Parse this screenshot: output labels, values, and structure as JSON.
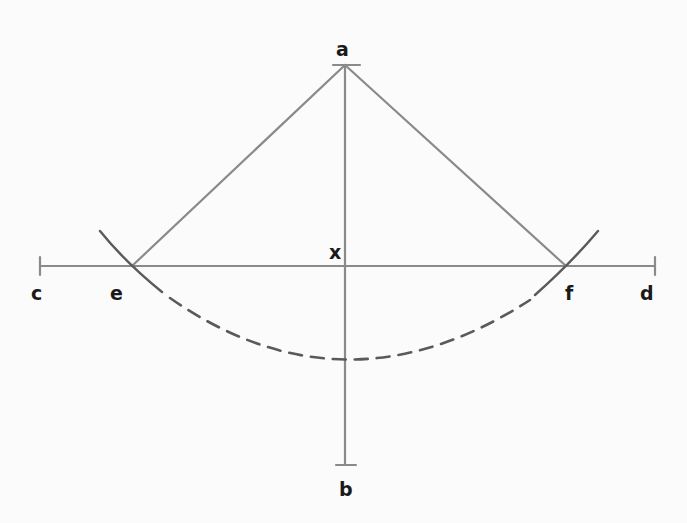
{
  "diagram": {
    "title": "",
    "points": {
      "a": {
        "label": "a",
        "x": 345,
        "y": 65
      },
      "b": {
        "label": "b",
        "x": 345,
        "y": 465
      },
      "c": {
        "label": "c",
        "x": 40,
        "y": 265
      },
      "d": {
        "label": "d",
        "x": 655,
        "y": 265
      },
      "e": {
        "label": "e",
        "x": 132,
        "y": 265
      },
      "f": {
        "label": "f",
        "x": 565,
        "y": 265
      },
      "x": {
        "label": "x",
        "x": 345,
        "y": 265
      }
    },
    "labels": {
      "a": "a",
      "b": "b",
      "c": "c",
      "d": "d",
      "e": "e",
      "f": "f",
      "x": "x"
    },
    "elements": [
      {
        "type": "segment",
        "from": "a",
        "to": "b",
        "description": "vertical line ab with end ticks"
      },
      {
        "type": "segment",
        "from": "c",
        "to": "d",
        "description": "horizontal line cd with end ticks"
      },
      {
        "type": "segment",
        "from": "a",
        "to": "e"
      },
      {
        "type": "segment",
        "from": "a",
        "to": "f"
      },
      {
        "type": "arc",
        "center": "a",
        "radius": 290,
        "style": "solid",
        "through": "e"
      },
      {
        "type": "arc",
        "center": "a",
        "radius": 290,
        "style": "solid",
        "through": "f"
      },
      {
        "type": "arc",
        "center": "a",
        "radius": 290,
        "style": "dashed",
        "from": "e",
        "to": "f"
      }
    ],
    "colors": {
      "line": "#8a8a8a",
      "arc": "#5a5a5a",
      "label": "#1a1a1a",
      "background": "#fbfbfb"
    }
  }
}
